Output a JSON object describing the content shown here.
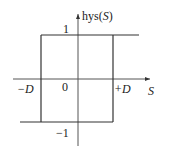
{
  "diagram": {
    "y_axis_label": {
      "prefix": "hys(",
      "var": "S",
      "suffix": ")"
    },
    "x_axis_label": "S",
    "labels": {
      "one": "1",
      "minus_one": "−1",
      "origin": "0",
      "minus_D": "−D",
      "plus_D": "+D"
    },
    "colors": {
      "line": "#333333",
      "axis": "#555555",
      "text": "#222222"
    }
  }
}
